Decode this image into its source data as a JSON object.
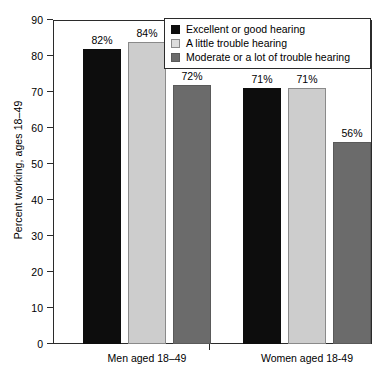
{
  "chart_data": {
    "type": "bar",
    "title": "",
    "subtitle": "",
    "xlabel": "",
    "ylabel": "Percent working, ages 18–49",
    "ylim": [
      0,
      90
    ],
    "yticks": [
      "0",
      "10",
      "20",
      "30",
      "40",
      "50",
      "60",
      "70",
      "80",
      "90"
    ],
    "ytick_values": [
      0,
      10,
      20,
      30,
      40,
      50,
      60,
      70,
      80,
      90
    ],
    "grid": false,
    "legend_position": "top-right",
    "categories": [
      "Men aged 18–49",
      "Women aged 18-49"
    ],
    "series": [
      {
        "name": "Excellent or good hearing",
        "color": "#0d0d0d",
        "values": [
          82,
          71
        ],
        "labels": [
          "82%",
          "71%"
        ]
      },
      {
        "name": "A little trouble hearing",
        "color": "#cdcdcd",
        "values": [
          84,
          71
        ],
        "labels": [
          "84%",
          "71%"
        ]
      },
      {
        "name": "Moderate or a lot of trouble hearing",
        "color": "#6b6b6b",
        "values": [
          72,
          56
        ],
        "labels": [
          "72%",
          "56%"
        ]
      }
    ]
  },
  "axis": {
    "y_title": "Percent working, ages 18–49",
    "y_tick_labels": [
      "90",
      "80",
      "70",
      "60",
      "50",
      "40",
      "30",
      "20",
      "10",
      "0"
    ],
    "x_tick_labels": [
      "Men aged 18–49",
      "Women aged 18-49"
    ]
  },
  "legend": {
    "items": [
      {
        "label": "Excellent or good hearing",
        "swatch": "black"
      },
      {
        "label": "A little trouble hearing",
        "swatch": "light"
      },
      {
        "label": "Moderate or a lot of trouble hearing",
        "swatch": "medium"
      }
    ]
  },
  "bar_labels": {
    "men": [
      "82%",
      "84%",
      "72%"
    ],
    "women": [
      "71%",
      "71%",
      "56%"
    ]
  },
  "colors": {
    "series_1": "#0d0d0d",
    "series_2": "#cdcdcd",
    "series_3": "#6b6b6b",
    "axis": "#2b2b2b",
    "background": "#ffffff"
  }
}
